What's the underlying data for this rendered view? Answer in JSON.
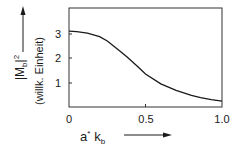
{
  "chart_data": {
    "type": "line",
    "title": "",
    "xlabel": "a* k_b",
    "ylabel": "|M_b|²",
    "ylabel_unit": "(willk. Einheit)",
    "xlim": [
      0,
      1.0
    ],
    "ylim": [
      0,
      4.05
    ],
    "x_ticks": [
      "0",
      "0.5",
      "1.0"
    ],
    "y_ticks": [
      "1",
      "2",
      "3"
    ],
    "grid": false,
    "legend": null,
    "series": [
      {
        "name": "|M_b|^2",
        "x": [
          0.0,
          0.05,
          0.12,
          0.2,
          0.25,
          0.33,
          0.38,
          0.45,
          0.5,
          0.6,
          0.7,
          0.8,
          0.86,
          0.93,
          1.0
        ],
        "values": [
          3.1,
          3.08,
          3.02,
          2.88,
          2.7,
          2.3,
          2.05,
          1.65,
          1.35,
          0.95,
          0.68,
          0.48,
          0.38,
          0.3,
          0.24
        ]
      }
    ]
  },
  "labels": {
    "x_zero": "0",
    "x_half": "0.5",
    "x_one": "1.0",
    "y_one": "1",
    "y_two": "2",
    "y_three": "3",
    "x_axis_label_a": "a",
    "x_axis_label_star": "*",
    "x_axis_label_k": "k",
    "x_axis_label_sub": "b",
    "y_axis_label_M": "|M",
    "y_axis_label_sub": "b",
    "y_axis_label_close": "|",
    "y_axis_label_sup": "2",
    "y_axis_unit": "(willk. Einheit)"
  }
}
